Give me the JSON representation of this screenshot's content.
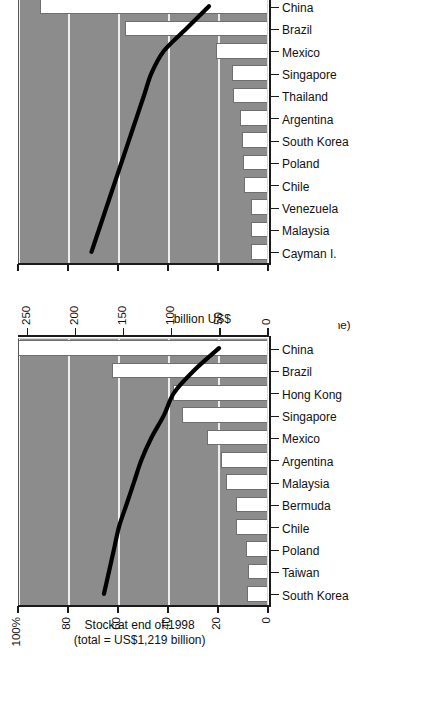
{
  "page": {
    "background_color": "#ffffff",
    "plot_background_color": "#8c8c8c",
    "bar_fill_color": "#ffffff",
    "line_color": "#000000",
    "gridline_color": "#efefef",
    "orientation_note": "charts rendered rotated 90 degrees counter-clockwise on page"
  },
  "charts": [
    {
      "id": "flow-1998",
      "title_line1": "Flow during 1998",
      "title_line2": "(total = US$166 billion)",
      "left_axis_label": "100 %",
      "right_axis_label": "billion US$",
      "line_note": "(line)",
      "bars_note": "(bars)",
      "left_ticks": [
        "0",
        "20",
        "40",
        "60",
        "80",
        "100 %"
      ],
      "right_ticks": [
        "0",
        "10",
        "20",
        "30",
        "40",
        "50"
      ],
      "categories": [
        "Cayman I.",
        "Malaysia",
        "Venezuela",
        "Chile",
        "Poland",
        "South Korea",
        "Argentina",
        "Thailand",
        "Singapore",
        "Mexico",
        "Brazil",
        "China"
      ]
    },
    {
      "id": "stock-end-1998",
      "title_line1": "Stock at end of 1998",
      "title_line2": "(total = US$1,219 billion)",
      "left_axis_label": "100%",
      "right_axis_label": "billion US$",
      "left_ticks": [
        "0",
        "20",
        "40",
        "60",
        "80",
        "100%"
      ],
      "right_ticks": [
        "0",
        "50",
        "100",
        "150",
        "200",
        "250"
      ],
      "categories": [
        "South Korea",
        "Taiwan",
        "Poland",
        "Chile",
        "Bermuda",
        "Malaysia",
        "Argentina",
        "Mexico",
        "Singapore",
        "Hong Kong",
        "Brazil",
        "China"
      ]
    }
  ],
  "chart_data": [
    {
      "type": "bar",
      "id": "flow-1998",
      "title": "Flow during 1998 (total = US$166 billion)",
      "xlabel": "",
      "ylabel": "billion US$",
      "y2label": "100 %",
      "grid": true,
      "legend_position": "none",
      "categories": [
        "Cayman I.",
        "Malaysia",
        "Venezuela",
        "Chile",
        "Poland",
        "South Korea",
        "Argentina",
        "Thailand",
        "Singapore",
        "Mexico",
        "Brazil",
        "China"
      ],
      "bar_axis": {
        "name": "billion US$",
        "side": "right",
        "ylim": [
          0,
          50
        ],
        "ticks": [
          0,
          10,
          20,
          30,
          40,
          50
        ]
      },
      "line_axis": {
        "name": "percent of total",
        "side": "left",
        "ylim": [
          0,
          100
        ],
        "ticks": [
          0,
          20,
          40,
          60,
          80,
          100
        ]
      },
      "series": [
        {
          "name": "Flow during 1998 (bars, billion US$)",
          "kind": "bar",
          "axis": "right",
          "values": [
            3.3,
            3.3,
            3.3,
            4.6,
            4.9,
            5.0,
            5.4,
            6.8,
            7.0,
            10.2,
            28.5,
            45.5
          ]
        },
        {
          "name": "Cumulative share (line, %)",
          "kind": "line",
          "axis": "left",
          "values": [
            71,
            68,
            65,
            62,
            59,
            56,
            53,
            50,
            47,
            42,
            33,
            24
          ]
        }
      ],
      "annotations": [
        "(line)",
        "(bars)"
      ]
    },
    {
      "type": "bar",
      "id": "stock-end-1998",
      "title": "Stock at end of 1998 (total = US$1,219 billion)",
      "xlabel": "",
      "ylabel": "billion US$",
      "y2label": "100%",
      "grid": true,
      "legend_position": "none",
      "categories": [
        "South Korea",
        "Taiwan",
        "Poland",
        "Chile",
        "Bermuda",
        "Malaysia",
        "Argentina",
        "Mexico",
        "Singapore",
        "Hong Kong",
        "Brazil",
        "China"
      ],
      "bar_axis": {
        "name": "billion US$",
        "side": "right",
        "ylim": [
          0,
          260
        ],
        "ticks": [
          0,
          50,
          100,
          150,
          200,
          250
        ]
      },
      "line_axis": {
        "name": "percent of total",
        "side": "left",
        "ylim": [
          0,
          100
        ],
        "ticks": [
          0,
          20,
          40,
          60,
          80,
          100
        ]
      },
      "series": [
        {
          "name": "Stock at end of 1998 (bars, billion US$)",
          "kind": "bar",
          "axis": "right",
          "values": [
            21,
            20,
            22,
            32,
            32,
            43,
            48,
            62,
            88,
            98,
            161,
            262
          ]
        },
        {
          "name": "Cumulative share (line, %)",
          "kind": "line",
          "axis": "left",
          "values": [
            66,
            64,
            62,
            60,
            57,
            54,
            51,
            47,
            42,
            38,
            30,
            20
          ]
        }
      ],
      "annotations": []
    }
  ]
}
